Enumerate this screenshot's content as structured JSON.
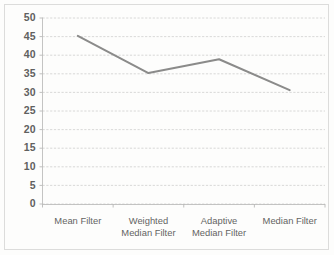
{
  "chart_data": {
    "type": "line",
    "title": "",
    "subtitle": "",
    "xlabel": "",
    "ylabel": "",
    "categories": [
      "Mean Filter",
      "Weighted Median Filter",
      "Adaptive Median Filter",
      "Median Filter"
    ],
    "category_lines": [
      [
        "Mean Filter"
      ],
      [
        "Weighted",
        "Median Filter"
      ],
      [
        "Adaptive",
        "Median Filter"
      ],
      [
        "Median Filter"
      ]
    ],
    "values": [
      45.2,
      35.2,
      38.9,
      30.6
    ],
    "series": [
      {
        "name": "",
        "values": [
          45.2,
          35.2,
          38.9,
          30.6
        ]
      }
    ],
    "ylim": [
      0,
      50
    ],
    "ytick_step": 5,
    "yticks": [
      50,
      45,
      40,
      35,
      30,
      25,
      20,
      15,
      10,
      5,
      0
    ],
    "ytick_labels": [
      "50",
      "45",
      "40",
      "35",
      "30",
      "25",
      "20",
      "15",
      "10",
      "5",
      "0"
    ],
    "grid": true,
    "grid_axis": "y",
    "grid_style": "dotted",
    "legend": false,
    "legend_position": "none",
    "markers": false,
    "line_color": "#7b7b7b",
    "grid_color": "#c9c9c9",
    "axis_color": "#b4b4b4",
    "label_color": "#4a4a4a",
    "background_color": "#fdfdfd"
  }
}
